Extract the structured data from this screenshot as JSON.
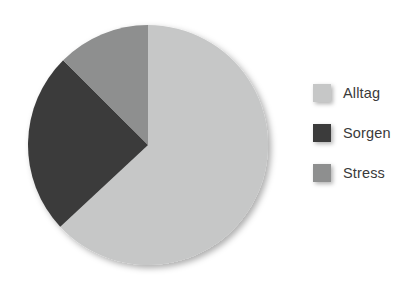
{
  "chart_data": {
    "type": "pie",
    "title": "",
    "labels": [
      "Alltag",
      "Sorgen",
      "Stress"
    ],
    "values": [
      63,
      24,
      13
    ],
    "unit": "%",
    "colors": [
      "#c6c7c7",
      "#3b3b3b",
      "#8e8f8f"
    ],
    "start_angle_deg": 0,
    "direction": "clockwise",
    "legend_position": "right",
    "grid": false,
    "slices": [
      {
        "label": "Alltag",
        "value": 63,
        "color": "#c6c7c7",
        "start_deg": 0,
        "end_deg": 227
      },
      {
        "label": "Sorgen",
        "value": 24,
        "color": "#3b3b3b",
        "start_deg": 227,
        "end_deg": 315
      },
      {
        "label": "Stress",
        "value": 13,
        "color": "#8e8f8f",
        "start_deg": 315,
        "end_deg": 360
      }
    ]
  },
  "legend": {
    "items": [
      {
        "label": "Alltag",
        "color": "#c6c7c7",
        "swatch_name": "legend-swatch-alltag"
      },
      {
        "label": "Sorgen",
        "color": "#3b3b3b",
        "swatch_name": "legend-swatch-sorgen"
      },
      {
        "label": "Stress",
        "color": "#8e8f8f",
        "swatch_name": "legend-swatch-stress"
      }
    ]
  },
  "geometry": {
    "center_x": 121,
    "center_y": 121,
    "radius": 120
  },
  "colors": {
    "background": "#ffffff",
    "text": "#3a3a3a",
    "shadow": "rgba(0,0,0,0.30)"
  }
}
